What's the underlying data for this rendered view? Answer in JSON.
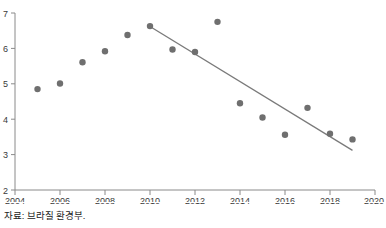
{
  "figure": {
    "top_note": "",
    "caption": "자료: 브라질 환경부."
  },
  "colors": {
    "marker": "#6f6f6f",
    "trendline": "#7a7a7a",
    "axis": "#8a8a8a",
    "tick_label": "#3a3a3a",
    "background": "#ffffff"
  },
  "chart_data": {
    "type": "scatter",
    "title": "",
    "subtitle": "",
    "xlabel": "",
    "ylabel": "",
    "xlim": [
      2004,
      2020
    ],
    "ylim": [
      2,
      7
    ],
    "xticks": [
      2004,
      2006,
      2008,
      2010,
      2012,
      2014,
      2016,
      2018,
      2020
    ],
    "xtick_labels": [
      "2004",
      "2006",
      "2008",
      "2010",
      "2012",
      "2014",
      "2016",
      "2018",
      "2020"
    ],
    "yticks": [
      2,
      3,
      4,
      5,
      6,
      7
    ],
    "ytick_labels": [
      "2",
      "3",
      "4",
      "5",
      "6",
      "7"
    ],
    "grid": false,
    "legend": false,
    "legend_position": "none",
    "series": [
      {
        "name": "observations",
        "type": "scatter",
        "marker": "circle",
        "color": "#6f6f6f",
        "x": [
          2005,
          2006,
          2007,
          2008,
          2009,
          2010,
          2011,
          2012,
          2013,
          2014,
          2015,
          2016,
          2017,
          2018,
          2019
        ],
        "values": [
          4.85,
          5.01,
          5.61,
          5.92,
          6.38,
          6.63,
          5.97,
          5.9,
          6.75,
          4.45,
          4.05,
          3.56,
          4.32,
          3.59,
          3.43
        ]
      },
      {
        "name": "trend-line",
        "type": "line",
        "color": "#7a7a7a",
        "x": [
          2010,
          2019
        ],
        "values": [
          6.62,
          3.12
        ]
      }
    ],
    "annotations": []
  }
}
